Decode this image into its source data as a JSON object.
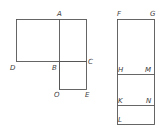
{
  "figure_left": {
    "labels": {
      "A": "A",
      "B": "B",
      "C": "C",
      "D": "D",
      "O": "O",
      "E": "E"
    }
  },
  "figure_right": {
    "labels": {
      "F": "F",
      "G": "G",
      "H": "H",
      "M": "M",
      "K": "K",
      "N": "N",
      "L": "L"
    }
  },
  "colors": {
    "line": "#555555",
    "text": "#3a3a3a",
    "background": "#ffffff"
  }
}
